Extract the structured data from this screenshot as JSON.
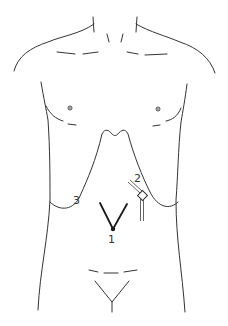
{
  "diagram": {
    "type": "anatomical-torso-port-placement",
    "colors": {
      "background": "#ffffff",
      "outline": "#333333",
      "marker": "#1a1a1a"
    },
    "markers": [
      {
        "id": 1,
        "label": "1",
        "description": "umbilical V-shaped incision/port"
      },
      {
        "id": 2,
        "label": "2",
        "description": "instrument/trocar at right upper quadrant"
      },
      {
        "id": 3,
        "label": "3",
        "description": "left flank port site"
      }
    ]
  }
}
